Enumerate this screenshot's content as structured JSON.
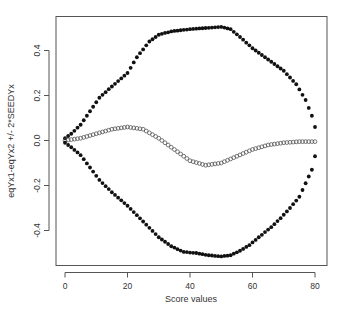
{
  "chart_data": {
    "type": "scatter",
    "title": "",
    "xlabel": "Score values",
    "ylabel": "eqYx1-eqYx2 +/- 2*SEEDYx",
    "xlim": [
      -3,
      84
    ],
    "ylim": [
      -0.55,
      0.55
    ],
    "x_ticks": [
      0,
      20,
      40,
      60,
      80
    ],
    "x_tick_labels": [
      "0",
      "20",
      "40",
      "60",
      "80"
    ],
    "y_ticks": [
      -0.4,
      -0.2,
      0.0,
      0.2,
      0.4
    ],
    "y_tick_labels": [
      "-0.4",
      "-0.2",
      "0.0",
      "0.2",
      "0.4"
    ],
    "grid": false,
    "legend": null,
    "x": [
      0,
      1,
      2,
      3,
      4,
      5,
      6,
      7,
      8,
      9,
      10,
      11,
      12,
      13,
      14,
      15,
      16,
      17,
      18,
      19,
      20,
      21,
      22,
      23,
      24,
      25,
      26,
      27,
      28,
      29,
      30,
      31,
      32,
      33,
      34,
      35,
      36,
      37,
      38,
      39,
      40,
      41,
      42,
      43,
      44,
      45,
      46,
      47,
      48,
      49,
      50,
      51,
      52,
      53,
      54,
      55,
      56,
      57,
      58,
      59,
      60,
      61,
      62,
      63,
      64,
      65,
      66,
      67,
      68,
      69,
      70,
      71,
      72,
      73,
      74,
      75,
      76,
      77,
      78,
      79,
      80
    ],
    "series": [
      {
        "name": "upper (eqYx1-eqYx2 + 2*SEEDYx)",
        "marker": "filled-circle",
        "color": "#111111",
        "values": [
          0.01,
          0.02,
          0.03,
          0.043,
          0.057,
          0.07,
          0.09,
          0.11,
          0.13,
          0.15,
          0.17,
          0.19,
          0.203,
          0.215,
          0.228,
          0.24,
          0.252,
          0.264,
          0.276,
          0.288,
          0.3,
          0.323,
          0.347,
          0.37,
          0.388,
          0.405,
          0.423,
          0.44,
          0.45,
          0.46,
          0.47,
          0.474,
          0.478,
          0.481,
          0.485,
          0.487,
          0.488,
          0.49,
          0.492,
          0.493,
          0.495,
          0.496,
          0.497,
          0.498,
          0.499,
          0.5,
          0.501,
          0.502,
          0.503,
          0.504,
          0.505,
          0.502,
          0.498,
          0.495,
          0.483,
          0.472,
          0.46,
          0.448,
          0.435,
          0.423,
          0.41,
          0.4,
          0.39,
          0.38,
          0.37,
          0.36,
          0.35,
          0.34,
          0.33,
          0.32,
          0.31,
          0.295,
          0.28,
          0.265,
          0.25,
          0.227,
          0.203,
          0.18,
          0.145,
          0.11,
          0.06
        ]
      },
      {
        "name": "eqYx1-eqYx2",
        "marker": "open-circle",
        "color": "#555555",
        "values": [
          0.0,
          0.002,
          0.004,
          0.006,
          0.008,
          0.01,
          0.014,
          0.018,
          0.022,
          0.026,
          0.03,
          0.034,
          0.038,
          0.042,
          0.046,
          0.05,
          0.052,
          0.054,
          0.056,
          0.058,
          0.06,
          0.058,
          0.056,
          0.054,
          0.052,
          0.05,
          0.042,
          0.034,
          0.026,
          0.018,
          0.01,
          0.0,
          -0.01,
          -0.02,
          -0.03,
          -0.04,
          -0.05,
          -0.06,
          -0.07,
          -0.08,
          -0.09,
          -0.094,
          -0.098,
          -0.102,
          -0.106,
          -0.11,
          -0.108,
          -0.106,
          -0.104,
          -0.102,
          -0.1,
          -0.094,
          -0.088,
          -0.082,
          -0.076,
          -0.07,
          -0.064,
          -0.058,
          -0.052,
          -0.046,
          -0.04,
          -0.036,
          -0.032,
          -0.028,
          -0.024,
          -0.02,
          -0.018,
          -0.016,
          -0.014,
          -0.012,
          -0.01,
          -0.009,
          -0.008,
          -0.007,
          -0.006,
          -0.005,
          -0.005,
          -0.005,
          -0.005,
          -0.005,
          -0.005
        ]
      },
      {
        "name": "lower (eqYx1-eqYx2 - 2*SEEDYx)",
        "marker": "filled-circle",
        "color": "#111111",
        "values": [
          -0.01,
          -0.02,
          -0.03,
          -0.042,
          -0.053,
          -0.065,
          -0.083,
          -0.102,
          -0.12,
          -0.138,
          -0.157,
          -0.175,
          -0.189,
          -0.203,
          -0.216,
          -0.23,
          -0.242,
          -0.254,
          -0.266,
          -0.278,
          -0.29,
          -0.304,
          -0.318,
          -0.332,
          -0.346,
          -0.36,
          -0.374,
          -0.388,
          -0.402,
          -0.416,
          -0.43,
          -0.44,
          -0.45,
          -0.46,
          -0.47,
          -0.476,
          -0.483,
          -0.489,
          -0.495,
          -0.496,
          -0.498,
          -0.499,
          -0.5,
          -0.503,
          -0.505,
          -0.508,
          -0.51,
          -0.511,
          -0.513,
          -0.514,
          -0.515,
          -0.513,
          -0.512,
          -0.51,
          -0.503,
          -0.497,
          -0.49,
          -0.482,
          -0.473,
          -0.465,
          -0.453,
          -0.442,
          -0.43,
          -0.419,
          -0.407,
          -0.396,
          -0.385,
          -0.372,
          -0.358,
          -0.345,
          -0.33,
          -0.315,
          -0.3,
          -0.283,
          -0.267,
          -0.25,
          -0.22,
          -0.19,
          -0.16,
          -0.13,
          -0.07
        ]
      }
    ]
  }
}
